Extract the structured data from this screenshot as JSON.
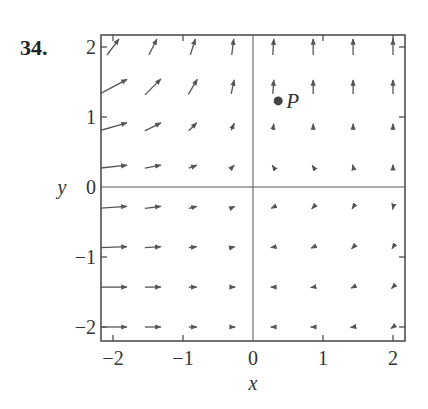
{
  "problem_number": "34.",
  "chart_data": {
    "type": "vector_field",
    "title": "",
    "xlabel": "x",
    "ylabel": "y",
    "xlim": [
      -2.2,
      2.2
    ],
    "ylim": [
      -2.2,
      2.2
    ],
    "x_ticks": [
      -2,
      -1,
      0,
      1,
      2
    ],
    "y_ticks": [
      -2,
      -1,
      0,
      1,
      2
    ],
    "x_tick_labels": [
      "−2",
      "−1",
      "0",
      "1",
      "2"
    ],
    "y_tick_labels": [
      "−2",
      "−1",
      "0",
      "1",
      "2"
    ],
    "grid": false,
    "axes_through_origin": true,
    "arrow_color": "#555555",
    "grid_points_x": [
      -2,
      -1.43,
      -0.86,
      -0.29,
      0.29,
      0.86,
      1.43,
      2
    ],
    "grid_points_y": [
      2,
      1.43,
      0.86,
      0.29,
      -0.29,
      -0.86,
      -1.43,
      -2
    ],
    "arrows_px_offsets_note": "dx,dy in pixels per grid point, row-major from top",
    "arrows": [
      [
        [
          12,
          -16
        ],
        [
          8,
          -16
        ],
        [
          5,
          -16
        ],
        [
          2,
          -16
        ],
        [
          1,
          -16
        ],
        [
          0,
          -16
        ],
        [
          0,
          -16
        ],
        [
          0,
          -16
        ]
      ],
      [
        [
          28,
          -15
        ],
        [
          16,
          -16
        ],
        [
          9,
          -15
        ],
        [
          3,
          -14
        ],
        [
          1,
          -14
        ],
        [
          0,
          -14
        ],
        [
          0,
          -14
        ],
        [
          0,
          -14
        ]
      ],
      [
        [
          28,
          -8
        ],
        [
          16,
          -8
        ],
        [
          8,
          -8
        ],
        [
          3,
          -7
        ],
        [
          1,
          -6
        ],
        [
          0,
          -6
        ],
        [
          0,
          -6
        ],
        [
          0,
          -6
        ]
      ],
      [
        [
          28,
          -3
        ],
        [
          16,
          -3
        ],
        [
          8,
          -3
        ],
        [
          3,
          -3
        ],
        [
          -2,
          -3
        ],
        [
          -2,
          -3
        ],
        [
          -1,
          -4
        ],
        [
          0,
          -4
        ]
      ],
      [
        [
          28,
          -2
        ],
        [
          16,
          -2
        ],
        [
          8,
          -2
        ],
        [
          4,
          -2
        ],
        [
          -4,
          2
        ],
        [
          -3,
          3
        ],
        [
          -2,
          3
        ],
        [
          -1,
          4
        ]
      ],
      [
        [
          28,
          -1
        ],
        [
          16,
          -1
        ],
        [
          8,
          -1
        ],
        [
          4,
          -1
        ],
        [
          -5,
          1
        ],
        [
          -4,
          2
        ],
        [
          -3,
          3
        ],
        [
          -2,
          3
        ]
      ],
      [
        [
          28,
          0
        ],
        [
          16,
          0
        ],
        [
          8,
          0
        ],
        [
          5,
          0
        ],
        [
          -5,
          0
        ],
        [
          -5,
          1
        ],
        [
          -4,
          2
        ],
        [
          -3,
          3
        ]
      ],
      [
        [
          28,
          0
        ],
        [
          16,
          0
        ],
        [
          8,
          0
        ],
        [
          5,
          0
        ],
        [
          -5,
          0
        ],
        [
          -5,
          0
        ],
        [
          -5,
          1
        ],
        [
          -4,
          3
        ]
      ]
    ],
    "annotations": [
      {
        "label": "P",
        "x": 0.36,
        "y": 1.23,
        "marker": "filled-circle"
      }
    ]
  }
}
